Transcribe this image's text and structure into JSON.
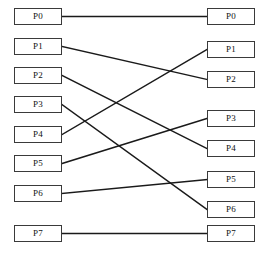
{
  "diagram": {
    "type": "bipartite-connection-diagram",
    "width": 269,
    "height": 259,
    "background_color": "#ffffff",
    "box": {
      "width": 48,
      "height": 17,
      "border_color": "#3a3a3a",
      "fill_color": "#ffffff",
      "text_color": "#111111"
    },
    "edge": {
      "color": "#1a1a1a",
      "width": 1.4
    },
    "left_column": {
      "name": "inputs",
      "x": 14,
      "nodes": [
        {
          "label": "P0",
          "index": 0,
          "y": 8
        },
        {
          "label": "P1",
          "index": 1,
          "y": 38
        },
        {
          "label": "P2",
          "index": 2,
          "y": 67
        },
        {
          "label": "P3",
          "index": 3,
          "y": 96
        },
        {
          "label": "P4",
          "index": 4,
          "y": 126
        },
        {
          "label": "P5",
          "index": 5,
          "y": 155
        },
        {
          "label": "P6",
          "index": 6,
          "y": 185
        },
        {
          "label": "P7",
          "index": 7,
          "y": 225
        }
      ]
    },
    "right_column": {
      "name": "outputs",
      "x": 207,
      "nodes": [
        {
          "label": "P0",
          "index": 0,
          "y": 8
        },
        {
          "label": "P1",
          "index": 1,
          "y": 41
        },
        {
          "label": "P2",
          "index": 2,
          "y": 71
        },
        {
          "label": "P3",
          "index": 3,
          "y": 110
        },
        {
          "label": "P4",
          "index": 4,
          "y": 140
        },
        {
          "label": "P5",
          "index": 5,
          "y": 171
        },
        {
          "label": "P6",
          "index": 6,
          "y": 201
        },
        {
          "label": "P7",
          "index": 7,
          "y": 225
        }
      ]
    },
    "connections": [
      {
        "from": 0,
        "to": 0,
        "from_label": "P0",
        "to_label": "P0"
      },
      {
        "from": 1,
        "to": 2,
        "from_label": "P1",
        "to_label": "P2"
      },
      {
        "from": 2,
        "to": 4,
        "from_label": "P2",
        "to_label": "P4"
      },
      {
        "from": 3,
        "to": 6,
        "from_label": "P3",
        "to_label": "P6"
      },
      {
        "from": 4,
        "to": 1,
        "from_label": "P4",
        "to_label": "P1"
      },
      {
        "from": 5,
        "to": 3,
        "from_label": "P5",
        "to_label": "P3"
      },
      {
        "from": 6,
        "to": 5,
        "from_label": "P6",
        "to_label": "P5"
      },
      {
        "from": 7,
        "to": 7,
        "from_label": "P7",
        "to_label": "P7"
      }
    ]
  }
}
